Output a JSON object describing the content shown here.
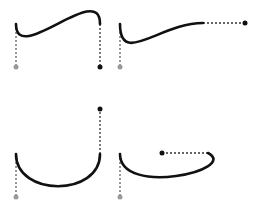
{
  "diagram": {
    "colors": {
      "curve": "#111111",
      "handle_line": "#333333",
      "start_handle_point": "#999999",
      "end_handle_point": "#111111",
      "background": "#ffffff"
    },
    "panels": [
      {
        "id": "panel-1",
        "start": [
          16,
          24
        ],
        "c1": [
          16,
          67
        ],
        "c2": [
          100,
          67
        ],
        "end": [
          100,
          24
        ],
        "path": "M16,24 C16,67 100,-20 100,24"
      },
      {
        "id": "panel-2",
        "start": [
          120,
          24
        ],
        "c1": [
          120,
          67
        ],
        "c2": [
          245,
          23
        ],
        "end": [
          203,
          23
        ],
        "path": "M120,24 C120,67 160,23 203,23"
      },
      {
        "id": "panel-3",
        "start": [
          16,
          154
        ],
        "c1": [
          16,
          197
        ],
        "c2": [
          100,
          109
        ],
        "end": [
          100,
          154
        ],
        "path": "M16,154 C16,197 100,197 100,154"
      },
      {
        "id": "panel-4",
        "start": [
          120,
          154
        ],
        "c1": [
          120,
          197
        ],
        "c2": [
          162,
          153
        ],
        "end": [
          208,
          153
        ],
        "path": "M120,154 C120,197 240,170 208,153"
      }
    ]
  }
}
